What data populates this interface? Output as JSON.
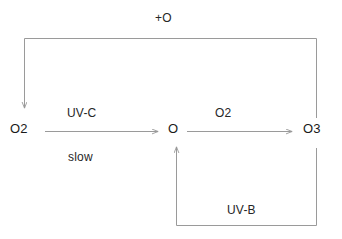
{
  "diagram": {
    "type": "reaction-flow",
    "background_color": "#ffffff",
    "line_color": "#9a9a9a",
    "text_color": "#1a1a1a",
    "nodes": [
      {
        "id": "o2-left",
        "label": "O2",
        "x": 20,
        "y": 129
      },
      {
        "id": "o",
        "label": "O",
        "x": 174,
        "y": 129
      },
      {
        "id": "o3",
        "label": "O3",
        "x": 314,
        "y": 129
      }
    ],
    "edges": [
      {
        "id": "o2-to-o",
        "from": "O2",
        "to": "O",
        "label_above": "UV-C",
        "label_below": "slow",
        "direction": "right"
      },
      {
        "id": "o-to-o3",
        "from": "O",
        "to": "O3",
        "label_above": "O2",
        "direction": "right"
      },
      {
        "id": "o3-to-o2-top",
        "from": "O3",
        "to": "O2",
        "label_above": "+O",
        "direction": "left-then-down"
      },
      {
        "id": "o3-to-o-bottom",
        "from": "O3",
        "to": "O",
        "label_above": "UV-B",
        "direction": "down-then-left-then-up"
      }
    ],
    "labels": {
      "plus_o": "+O",
      "uv_c": "UV-C",
      "slow": "slow",
      "o2_top": "O2",
      "uv_b": "UV-B",
      "o2_left_node": "O2",
      "o_node": "O",
      "o3_node": "O3"
    }
  }
}
